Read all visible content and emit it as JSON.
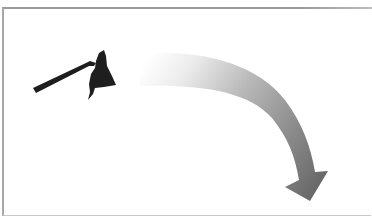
{
  "illustration": {
    "description": "Hoe silhouette with curved arrow pointing down-right",
    "hoe": {
      "label": "hoe",
      "color": "#1e1e1e"
    },
    "arrow": {
      "label": "curved arrow",
      "gradient_start": "#ffffff",
      "gradient_mid": "#b4b4b4",
      "gradient_end": "#6a6a6a"
    },
    "frame": {
      "border_color": "#9a9a9a",
      "background": "#ffffff"
    }
  }
}
